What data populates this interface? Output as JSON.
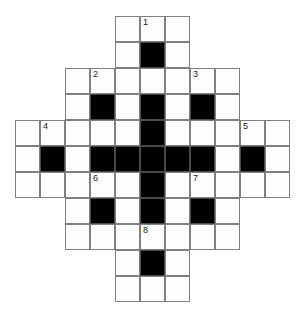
{
  "puzzle": {
    "type": "crossword-grid",
    "shape": "diamond",
    "rows": 11,
    "columns": 11,
    "cell_width": 25,
    "cell_height": 26,
    "origin_x": 15,
    "origin_y": 16,
    "colors": {
      "background": "#ffffff",
      "cell_fill": "#fdfdfd",
      "cell_border": "#808080",
      "block_fill": "#000000",
      "number_text": "#1a1a1a"
    },
    "clue_numbers": [
      "1",
      "2",
      "3",
      "4",
      "5",
      "6",
      "7",
      "8"
    ],
    "grid": [
      {
        "row": 1,
        "cells": [
          {
            "col": 5,
            "state": "open",
            "number": null
          },
          {
            "col": 6,
            "state": "open",
            "number": "1"
          },
          {
            "col": 7,
            "state": "open",
            "number": null
          }
        ]
      },
      {
        "row": 2,
        "cells": [
          {
            "col": 5,
            "state": "open",
            "number": null
          },
          {
            "col": 6,
            "state": "block",
            "number": null
          },
          {
            "col": 7,
            "state": "open",
            "number": null
          }
        ]
      },
      {
        "row": 3,
        "cells": [
          {
            "col": 3,
            "state": "open",
            "number": null
          },
          {
            "col": 4,
            "state": "open",
            "number": "2"
          },
          {
            "col": 5,
            "state": "open",
            "number": null
          },
          {
            "col": 6,
            "state": "open",
            "number": null
          },
          {
            "col": 7,
            "state": "open",
            "number": null
          },
          {
            "col": 8,
            "state": "open",
            "number": "3"
          },
          {
            "col": 9,
            "state": "open",
            "number": null
          }
        ]
      },
      {
        "row": 4,
        "cells": [
          {
            "col": 3,
            "state": "open",
            "number": null
          },
          {
            "col": 4,
            "state": "block",
            "number": null
          },
          {
            "col": 5,
            "state": "open",
            "number": null
          },
          {
            "col": 6,
            "state": "block",
            "number": null
          },
          {
            "col": 7,
            "state": "open",
            "number": null
          },
          {
            "col": 8,
            "state": "block",
            "number": null
          },
          {
            "col": 9,
            "state": "open",
            "number": null
          }
        ]
      },
      {
        "row": 5,
        "cells": [
          {
            "col": 1,
            "state": "open",
            "number": null
          },
          {
            "col": 2,
            "state": "open",
            "number": "4"
          },
          {
            "col": 3,
            "state": "open",
            "number": null
          },
          {
            "col": 4,
            "state": "open",
            "number": null
          },
          {
            "col": 5,
            "state": "open",
            "number": null
          },
          {
            "col": 6,
            "state": "block",
            "number": null
          },
          {
            "col": 7,
            "state": "open",
            "number": null
          },
          {
            "col": 8,
            "state": "open",
            "number": null
          },
          {
            "col": 9,
            "state": "open",
            "number": null
          },
          {
            "col": 10,
            "state": "open",
            "number": "5"
          },
          {
            "col": 11,
            "state": "open",
            "number": null
          }
        ]
      },
      {
        "row": 6,
        "cells": [
          {
            "col": 1,
            "state": "open",
            "number": null
          },
          {
            "col": 2,
            "state": "block",
            "number": null
          },
          {
            "col": 3,
            "state": "open",
            "number": null
          },
          {
            "col": 4,
            "state": "block",
            "number": null
          },
          {
            "col": 5,
            "state": "block",
            "number": null
          },
          {
            "col": 6,
            "state": "block",
            "number": null
          },
          {
            "col": 7,
            "state": "block",
            "number": null
          },
          {
            "col": 8,
            "state": "block",
            "number": null
          },
          {
            "col": 9,
            "state": "open",
            "number": null
          },
          {
            "col": 10,
            "state": "block",
            "number": null
          },
          {
            "col": 11,
            "state": "open",
            "number": null
          }
        ]
      },
      {
        "row": 7,
        "cells": [
          {
            "col": 1,
            "state": "open",
            "number": null
          },
          {
            "col": 2,
            "state": "open",
            "number": null
          },
          {
            "col": 3,
            "state": "open",
            "number": null
          },
          {
            "col": 4,
            "state": "open",
            "number": "6"
          },
          {
            "col": 5,
            "state": "open",
            "number": null
          },
          {
            "col": 6,
            "state": "block",
            "number": null
          },
          {
            "col": 7,
            "state": "open",
            "number": null
          },
          {
            "col": 8,
            "state": "open",
            "number": "7"
          },
          {
            "col": 9,
            "state": "open",
            "number": null
          },
          {
            "col": 10,
            "state": "open",
            "number": null
          },
          {
            "col": 11,
            "state": "open",
            "number": null
          }
        ]
      },
      {
        "row": 8,
        "cells": [
          {
            "col": 3,
            "state": "open",
            "number": null
          },
          {
            "col": 4,
            "state": "block",
            "number": null
          },
          {
            "col": 5,
            "state": "open",
            "number": null
          },
          {
            "col": 6,
            "state": "block",
            "number": null
          },
          {
            "col": 7,
            "state": "open",
            "number": null
          },
          {
            "col": 8,
            "state": "block",
            "number": null
          },
          {
            "col": 9,
            "state": "open",
            "number": null
          }
        ]
      },
      {
        "row": 9,
        "cells": [
          {
            "col": 3,
            "state": "open",
            "number": null
          },
          {
            "col": 4,
            "state": "open",
            "number": null
          },
          {
            "col": 5,
            "state": "open",
            "number": null
          },
          {
            "col": 6,
            "state": "open",
            "number": "8"
          },
          {
            "col": 7,
            "state": "open",
            "number": null
          },
          {
            "col": 8,
            "state": "open",
            "number": null
          },
          {
            "col": 9,
            "state": "open",
            "number": null
          }
        ]
      },
      {
        "row": 10,
        "cells": [
          {
            "col": 5,
            "state": "open",
            "number": null
          },
          {
            "col": 6,
            "state": "block",
            "number": null
          },
          {
            "col": 7,
            "state": "open",
            "number": null
          }
        ]
      },
      {
        "row": 11,
        "cells": [
          {
            "col": 5,
            "state": "open",
            "number": null
          },
          {
            "col": 6,
            "state": "open",
            "number": null
          },
          {
            "col": 7,
            "state": "open",
            "number": null
          }
        ]
      }
    ]
  }
}
